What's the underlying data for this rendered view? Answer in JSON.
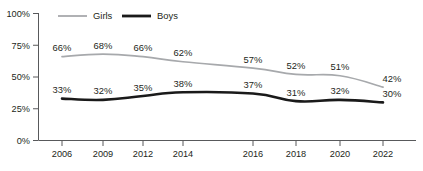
{
  "chart_data": {
    "type": "line",
    "title": "",
    "subtitle": "",
    "xlabel": "",
    "ylabel": "",
    "x": [
      "2006",
      "2009",
      "2012",
      "2014",
      "2016",
      "2018",
      "2020",
      "2022"
    ],
    "categories": [
      "2006",
      "2009",
      "2012",
      "2014",
      "2016",
      "2018",
      "2020",
      "2022"
    ],
    "ylim": [
      0,
      100
    ],
    "y_ticks": [
      "0%",
      "25%",
      "50%",
      "75%",
      "100%"
    ],
    "y_tick_values": [
      0,
      25,
      50,
      75,
      100
    ],
    "grid": false,
    "legend_position": "top-left",
    "series": [
      {
        "name": "Girls",
        "color": "#a7a9ac",
        "values": [
          66,
          68,
          66,
          62,
          57,
          52,
          51,
          42
        ],
        "labels": [
          "66%",
          "68%",
          "66%",
          "62%",
          "57%",
          "52%",
          "51%",
          "42%"
        ]
      },
      {
        "name": "Boys",
        "color": "#1a1a1a",
        "values": [
          33,
          32,
          35,
          38,
          37,
          31,
          32,
          30
        ],
        "labels": [
          "33%",
          "32%",
          "35%",
          "38%",
          "37%",
          "31%",
          "32%",
          "30%"
        ]
      }
    ]
  },
  "legend": {
    "items": [
      {
        "label": "Girls",
        "color": "#a7a9ac"
      },
      {
        "label": "Boys",
        "color": "#1a1a1a"
      }
    ]
  },
  "axis": {
    "y_labels": [
      "100%",
      "75%",
      "50%",
      "25%",
      "0%"
    ],
    "x_labels": [
      "2006",
      "2009",
      "2012",
      "2014",
      "2016",
      "2018",
      "2020",
      "2022"
    ]
  }
}
